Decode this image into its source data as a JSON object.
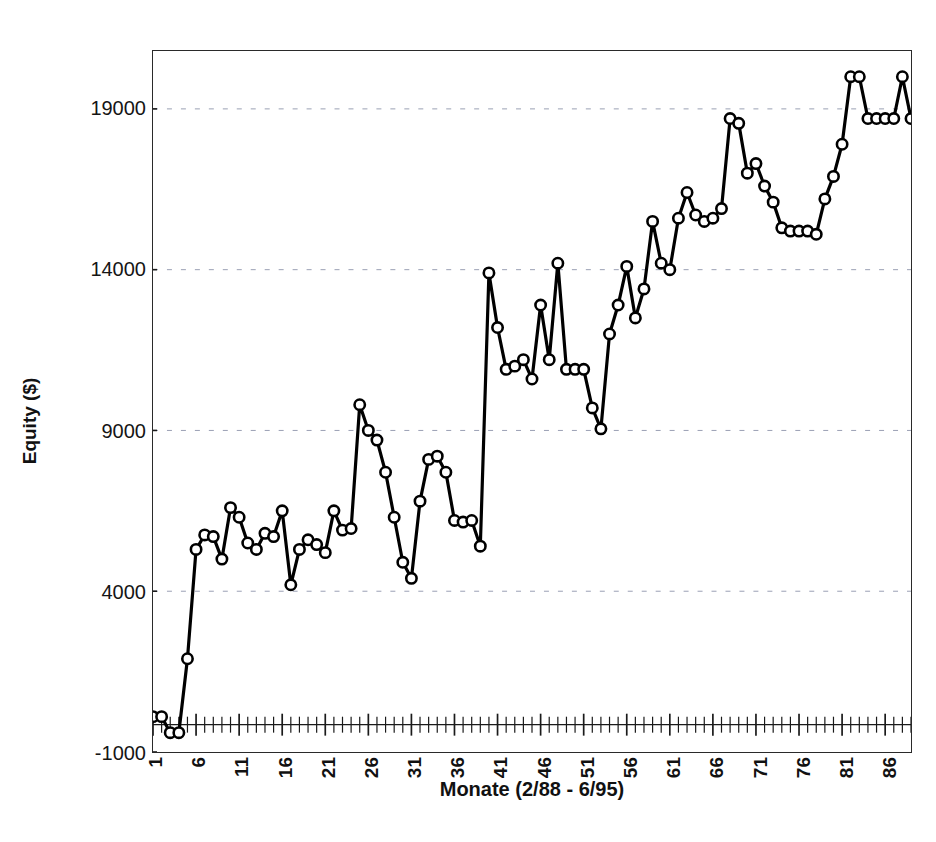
{
  "chart_data": {
    "type": "line",
    "title": "",
    "xlabel": "Monate (2/88 - 6/95)",
    "ylabel": "Equity ($)",
    "xlim": [
      1,
      89
    ],
    "ylim": [
      -1000,
      20800
    ],
    "yticks": [
      -1000,
      4000,
      9000,
      14000,
      19000
    ],
    "ytick_labels": [
      "-1000",
      "4000",
      "9000",
      "14000",
      "19000"
    ],
    "xticks": [
      1,
      6,
      11,
      16,
      21,
      26,
      31,
      36,
      41,
      46,
      51,
      56,
      61,
      66,
      71,
      76,
      81,
      86
    ],
    "xtick_labels": [
      "1",
      "6",
      "11",
      "16",
      "21",
      "26",
      "31",
      "36",
      "41",
      "46",
      "51",
      "56",
      "61",
      "66",
      "71",
      "76",
      "81",
      "86"
    ],
    "grid": "horizontal-dotted",
    "legend": "none",
    "marker": "open-circle",
    "series": [
      {
        "name": "Equity",
        "x": [
          1,
          2,
          3,
          4,
          5,
          6,
          7,
          8,
          9,
          10,
          11,
          12,
          13,
          14,
          15,
          16,
          17,
          18,
          19,
          20,
          21,
          22,
          23,
          24,
          25,
          26,
          27,
          28,
          29,
          30,
          31,
          32,
          33,
          34,
          35,
          36,
          37,
          38,
          39,
          40,
          41,
          42,
          43,
          44,
          45,
          46,
          47,
          48,
          49,
          50,
          51,
          52,
          53,
          54,
          55,
          56,
          57,
          58,
          59,
          60,
          61,
          62,
          63,
          64,
          65,
          66,
          67,
          68,
          69,
          70,
          71,
          72,
          73,
          74,
          75,
          76,
          77,
          78,
          79,
          80,
          81,
          82,
          83,
          84,
          85,
          86,
          87,
          88,
          89
        ],
        "values": [
          100,
          100,
          -400,
          -400,
          1900,
          5300,
          5750,
          5700,
          5000,
          6600,
          6300,
          5500,
          5300,
          5800,
          5700,
          6500,
          4200,
          5300,
          5600,
          5450,
          5200,
          6500,
          5900,
          5950,
          9800,
          9000,
          8700,
          7700,
          6300,
          4900,
          4400,
          6800,
          8100,
          8200,
          7700,
          6200,
          6150,
          6200,
          5400,
          13900,
          12200,
          10900,
          11000,
          11200,
          10600,
          12900,
          11200,
          14200,
          10900,
          10900,
          10900,
          9700,
          9050,
          12000,
          12900,
          14100,
          12500,
          13400,
          15500,
          14200,
          14000,
          15600,
          16400,
          15700,
          15500,
          15600,
          15900,
          18700,
          18550,
          17000,
          17300,
          16600,
          16100,
          15300,
          15200,
          15200,
          15200,
          15100,
          16200,
          16900,
          17900,
          20000,
          20000,
          18700,
          18700,
          18700,
          18700,
          20000,
          18700
        ]
      }
    ]
  },
  "axes": {
    "y_title": "Equity ($)",
    "x_title": "Monate (2/88 - 6/95)"
  },
  "style": {
    "line_color": "#000000",
    "marker_fill": "#ffffff",
    "marker_stroke": "#000000",
    "grid_color": "#9aa0b4",
    "frame_color": "#2a2a2a",
    "background": "#ffffff"
  }
}
